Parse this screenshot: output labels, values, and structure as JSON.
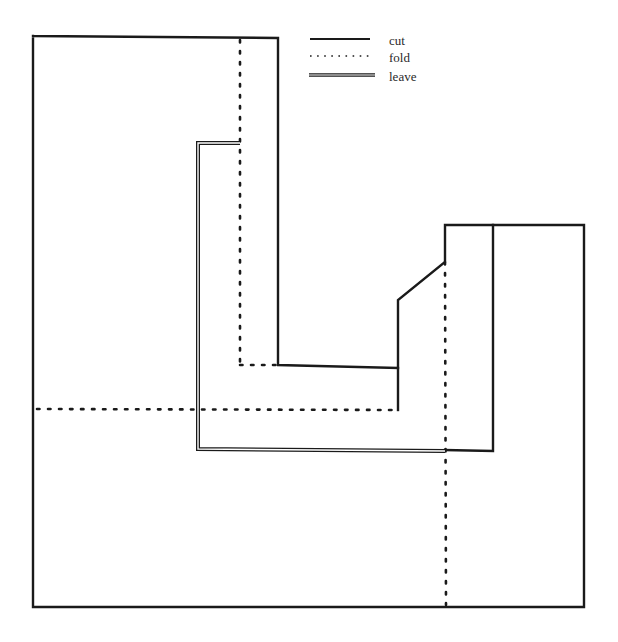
{
  "legend": {
    "items": [
      {
        "key": "cut",
        "label": "cut",
        "style": "solid"
      },
      {
        "key": "fold",
        "label": "fold",
        "style": "dotted"
      },
      {
        "key": "leave",
        "label": "leave",
        "style": "double"
      }
    ]
  },
  "colors": {
    "line": "#1a1a1a",
    "background": "#ffffff"
  },
  "geometry": {
    "cut_paths": [
      {
        "name": "outer-boundary",
        "points": "33,36 278,38 278,365 398,368 398,300 445,262 445,225 584,225 584,607 33,607 33,36"
      },
      {
        "name": "inner-step-cut",
        "points": "398,368 398,410"
      },
      {
        "name": "right-block-divider",
        "points": "493,225 493,451 445,450"
      }
    ],
    "fold_lines": [
      {
        "name": "left-vertical-fold",
        "x1": 240,
        "y1": 40,
        "x2": 240,
        "y2": 365
      },
      {
        "name": "left-inner-fold-bottom",
        "x1": 240,
        "y1": 365,
        "x2": 278,
        "y2": 365
      },
      {
        "name": "horizontal-fold",
        "x1": 37,
        "y1": 409,
        "x2": 398,
        "y2": 410
      },
      {
        "name": "right-vertical-fold",
        "x1": 445,
        "y1": 262,
        "x2": 446,
        "y2": 605
      }
    ],
    "leave_path": {
      "name": "leave-outline",
      "points": "240,143 198,143 198,449 445,451"
    }
  }
}
